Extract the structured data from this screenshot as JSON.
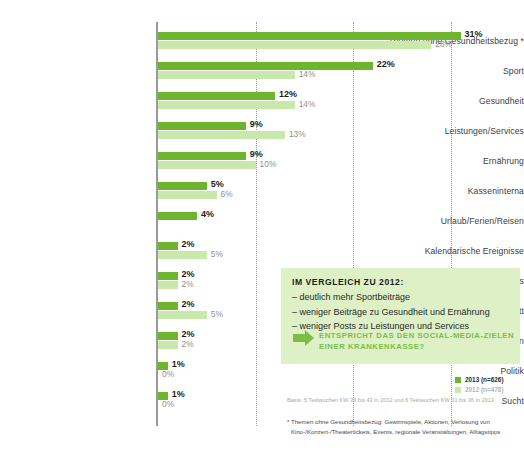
{
  "chart_data": {
    "type": "bar",
    "orientation": "horizontal",
    "title": "",
    "xlabel": "",
    "ylabel": "",
    "xlim": [
      0,
      33
    ],
    "gridlines": [
      10,
      20,
      30
    ],
    "grid": true,
    "legend_position": "bottom-right",
    "categories": [
      "Themen ohne Gesundheitsbezug *",
      "Sport",
      "Gesundheit",
      "Leistungen/Services",
      "Ernährung",
      "Kasseninterna",
      "Urlaub/Ferien/Reisen",
      "Kalendarische Ereignisse",
      "Jobs/Azubis",
      "Eigener Facebookauftritt",
      "Krankheiten",
      "Politik",
      "Sucht"
    ],
    "series": [
      {
        "name": "2013 (n=626)",
        "color": "#6cb52d",
        "values": [
          31,
          22,
          12,
          9,
          9,
          5,
          4,
          2,
          2,
          2,
          2,
          1,
          1
        ],
        "labels": [
          "31%",
          "22%",
          "12%",
          "9%",
          "9%",
          "5%",
          "4%",
          "2%",
          "2%",
          "2%",
          "2%",
          "1%",
          "1%"
        ]
      },
      {
        "name": "2012 (n=478)",
        "color": "#c9e8ac",
        "values": [
          28,
          14,
          14,
          13,
          10,
          6,
          null,
          5,
          2,
          5,
          2,
          0,
          0
        ],
        "labels": [
          "28%",
          "14%",
          "14%",
          "13%",
          "10%",
          "6%",
          "",
          "5%",
          "2%",
          "5%",
          "2%",
          "0%",
          "0%"
        ]
      }
    ]
  },
  "legend": {
    "items": [
      {
        "label": "2013 (n=626)",
        "color": "#6cb52d"
      },
      {
        "label": "2012 (n=478)",
        "color": "#c9e8ac"
      }
    ]
  },
  "callout": {
    "title": "IM VERGLEICH ZU 2012:",
    "items": [
      "– deutlich mehr Sportbeiträge",
      "– weniger Beiträge zu Gesundheit und Ernährung",
      "– weniger Posts zu Leistungen und Services"
    ],
    "question": "ENTSPRICHT DAS DEN SOCIAL-MEDIA-ZIELEN EINER KRANKENKASSE?",
    "background": "#ddf0c6",
    "accent": "#7cbd47"
  },
  "footer": {
    "basis": "Basis: 5 Testwochen KW 39 bis 43 in 2012 und 6 Testwochen KW 31 bis 36 in 2013",
    "footnote": "* Themen ohne Gesundheitsbezug: Gewinnspiele, Aktionen, Verlosung von Kino-/Konzert-/Theatertickets, Events, regionale Veranstaltungen, Alltagstipps"
  }
}
